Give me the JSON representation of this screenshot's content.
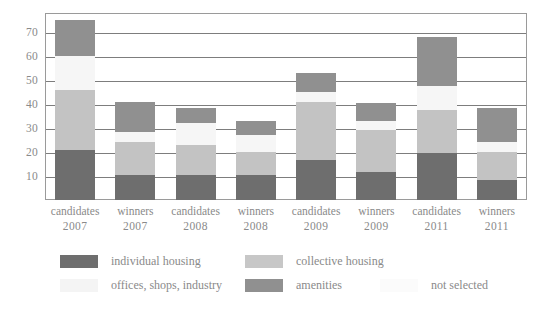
{
  "chart_data": {
    "type": "bar",
    "subtype": "stacked-bar",
    "title": "",
    "xlabel": "",
    "ylabel": "",
    "ylim": [
      0,
      78
    ],
    "yticks": [
      10,
      20,
      30,
      40,
      50,
      60,
      70
    ],
    "grid": true,
    "legend_position": "bottom",
    "categories": [
      "candidates 2007",
      "winners 2007",
      "candidates 2008",
      "winners 2008",
      "candidates 2009",
      "winners 2009",
      "candidates 2011",
      "winners 2011"
    ],
    "category_lines": [
      {
        "line1": "candidates",
        "line2": "2007"
      },
      {
        "line1": "winners",
        "line2": "2007"
      },
      {
        "line1": "candidates",
        "line2": "2008"
      },
      {
        "line1": "winners",
        "line2": "2008"
      },
      {
        "line1": "candidates",
        "line2": "2009"
      },
      {
        "line1": "winners",
        "line2": "2009"
      },
      {
        "line1": "candidates",
        "line2": "2011"
      },
      {
        "line1": "winners",
        "line2": "2011"
      }
    ],
    "series": [
      {
        "name": "individual housing",
        "color": "#6e6e6e",
        "values": [
          21,
          10.5,
          10.5,
          10.5,
          16.5,
          11.5,
          19.5,
          8.5
        ]
      },
      {
        "name": "collective housing",
        "color": "#c3c3c3",
        "values": [
          25,
          13.5,
          12.5,
          9.5,
          24.5,
          17.5,
          18,
          11.5
        ]
      },
      {
        "name": "offices, shops, industry",
        "color": "#f6f6f6",
        "values": [
          14,
          4.5,
          9,
          7,
          4,
          4,
          10,
          4
        ]
      },
      {
        "name": "amenities",
        "color": "#909090",
        "values": [
          15,
          12.5,
          6.5,
          6,
          8,
          7.5,
          20.5,
          14.5
        ]
      }
    ],
    "totals": [
      75,
      41,
      38.5,
      33,
      53,
      40.5,
      68,
      38.5
    ]
  },
  "legend": {
    "items": [
      {
        "label": "individual housing",
        "color": "#6e6e6e",
        "swatch": true
      },
      {
        "label": "collective housing",
        "color": "#c7c7c7",
        "swatch": true
      },
      {
        "label": "offices, shops, industry",
        "color": "#f4f4f4",
        "swatch": true
      },
      {
        "label": "amenities",
        "color": "#909090",
        "swatch": true
      },
      {
        "label": "not selected",
        "color": "#fbfbfb",
        "swatch": true
      }
    ]
  },
  "axis": {
    "y_tick_labels": [
      "70",
      "60",
      "50",
      "40",
      "30",
      "20",
      "10"
    ]
  }
}
